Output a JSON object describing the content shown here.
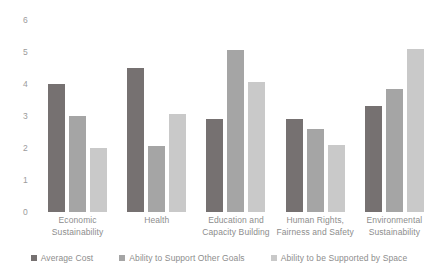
{
  "chart_data": {
    "type": "bar",
    "title": "",
    "subtitle": "",
    "xlabel": "",
    "ylabel": "",
    "ylim": [
      0,
      6
    ],
    "yticks": [
      0,
      1,
      2,
      3,
      4,
      5,
      6
    ],
    "ytick_labels": [
      "0",
      "1",
      "2",
      "3",
      "4",
      "5",
      "6"
    ],
    "grid": false,
    "legend_position": "bottom",
    "categories": [
      "Economic Sustainability",
      "Health",
      "Education and Capacity Building",
      "Human Rights, Fairness and Safety",
      "Environmental Sustainability"
    ],
    "category_lines": [
      [
        "Economic",
        "Sustainability"
      ],
      [
        "Health"
      ],
      [
        "Education and",
        "Capacity Building"
      ],
      [
        "Human Rights,",
        "Fairness and Safety"
      ],
      [
        "Environmental",
        "Sustainability"
      ]
    ],
    "series": [
      {
        "name": "Average Cost",
        "color": "#767171",
        "values": [
          4.0,
          4.5,
          2.9,
          2.9,
          3.3
        ]
      },
      {
        "name": "Ability to Support Other Goals",
        "color": "#a5a5a5",
        "values": [
          3.0,
          2.05,
          5.05,
          2.6,
          3.85
        ]
      },
      {
        "name": "Ability to be Supported by Space",
        "color": "#c9c9c9",
        "values": [
          2.0,
          3.05,
          4.05,
          2.1,
          5.1
        ]
      }
    ]
  },
  "legend": {
    "items": [
      {
        "label": "Average Cost"
      },
      {
        "label": "Ability to Support Other Goals"
      },
      {
        "label": "Ability to be Supported by Space"
      }
    ]
  }
}
